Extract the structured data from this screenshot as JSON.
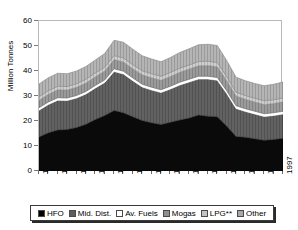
{
  "chart_title": "",
  "axes": {
    "y_label": "Million Tonnes",
    "y_ticks": [
      "0",
      "10",
      "20",
      "30",
      "40",
      "50",
      "60"
    ],
    "x_ticks": [
      "1971",
      "1973",
      "1975",
      "1977",
      "1979",
      "1981",
      "1983",
      "1985",
      "1987",
      "1989",
      "1991",
      "1993",
      "1995",
      "1997"
    ]
  },
  "legend": {
    "items": [
      {
        "label": "HFO",
        "color": "#000000"
      },
      {
        "label": "Mid. Dist.",
        "color": "#595959"
      },
      {
        "label": "Av. Fuels",
        "color": "#ffffff"
      },
      {
        "label": "Mogas",
        "color": "#8c8c8c"
      },
      {
        "label": "LPG**",
        "color": "#bfbfbf"
      },
      {
        "label": "Other",
        "color": "#a6a6a6"
      }
    ]
  },
  "chart_data": {
    "type": "area",
    "title": "",
    "xlabel": "",
    "ylabel": "Million Tonnes",
    "ylim": [
      0,
      60
    ],
    "xlim": [
      1971,
      1997
    ],
    "grid": false,
    "legend_position": "bottom",
    "stacked": true,
    "x": [
      1971,
      1972,
      1973,
      1974,
      1975,
      1976,
      1977,
      1978,
      1979,
      1980,
      1981,
      1982,
      1983,
      1984,
      1985,
      1986,
      1987,
      1988,
      1989,
      1990,
      1991,
      1992,
      1993,
      1994,
      1995,
      1996,
      1997
    ],
    "series": [
      {
        "name": "HFO",
        "color": "#000000",
        "values": [
          13.6,
          15.3,
          16.4,
          16.6,
          17.4,
          18.7,
          20.6,
          22.2,
          24.2,
          23.3,
          21.7,
          20.2,
          19.3,
          18.6,
          19.5,
          20.4,
          21.2,
          22.4,
          21.9,
          21.7,
          18.0,
          13.8,
          13.5,
          12.9,
          12.3,
          12.6,
          13.1
        ]
      },
      {
        "name": "Mid. Dist.",
        "color": "#595959",
        "values": [
          10.7,
          11.3,
          11.9,
          11.6,
          11.8,
          12.1,
          12.6,
          13.2,
          15.6,
          15.5,
          14.4,
          13.4,
          13.1,
          12.8,
          13.3,
          14.0,
          14.4,
          14.4,
          14.9,
          14.6,
          13.0,
          11.2,
          10.3,
          9.9,
          9.5,
          9.6,
          9.7
        ]
      },
      {
        "name": "Av. Fuels",
        "color": "#ffffff",
        "values": [
          1.0,
          1.0,
          1.0,
          1.0,
          1.0,
          1.0,
          1.0,
          1.0,
          1.1,
          1.1,
          1.1,
          1.1,
          1.1,
          1.1,
          1.1,
          1.1,
          1.1,
          1.1,
          1.1,
          1.1,
          1.1,
          1.1,
          1.1,
          1.1,
          1.1,
          1.1,
          1.1
        ]
      },
      {
        "name": "Mogas",
        "color": "#8c8c8c",
        "values": [
          3.0,
          3.1,
          3.2,
          3.2,
          3.3,
          3.4,
          3.5,
          3.6,
          3.7,
          3.7,
          3.7,
          3.8,
          3.8,
          3.8,
          3.9,
          4.0,
          4.1,
          4.2,
          4.3,
          4.3,
          4.1,
          3.9,
          3.8,
          3.7,
          3.7,
          3.7,
          3.8
        ]
      },
      {
        "name": "LPG**",
        "color": "#bfbfbf",
        "values": [
          1.4,
          1.4,
          1.4,
          1.4,
          1.4,
          1.5,
          1.5,
          1.5,
          1.6,
          1.6,
          1.6,
          1.6,
          1.6,
          1.6,
          1.6,
          1.6,
          1.6,
          1.7,
          1.7,
          1.7,
          1.6,
          1.5,
          1.5,
          1.5,
          1.5,
          1.5,
          1.5
        ]
      },
      {
        "name": "Other",
        "color": "#a6a6a6",
        "values": [
          5.1,
          5.2,
          5.2,
          5.1,
          5.1,
          5.1,
          5.2,
          5.5,
          6.1,
          6.3,
          6.2,
          6.0,
          5.9,
          5.8,
          6.0,
          6.3,
          6.5,
          6.7,
          6.8,
          6.8,
          6.4,
          6.0,
          5.9,
          5.9,
          6.0,
          6.2,
          6.4
        ]
      }
    ],
    "totals": [
      34.8,
      37.3,
      39.1,
      38.9,
      40.0,
      41.8,
      44.4,
      47.0,
      52.3,
      51.5,
      48.7,
      46.1,
      44.8,
      43.7,
      45.4,
      47.4,
      48.9,
      50.5,
      50.7,
      50.2,
      44.2,
      37.5,
      36.1,
      35.0,
      34.1,
      34.7,
      35.6
    ]
  }
}
